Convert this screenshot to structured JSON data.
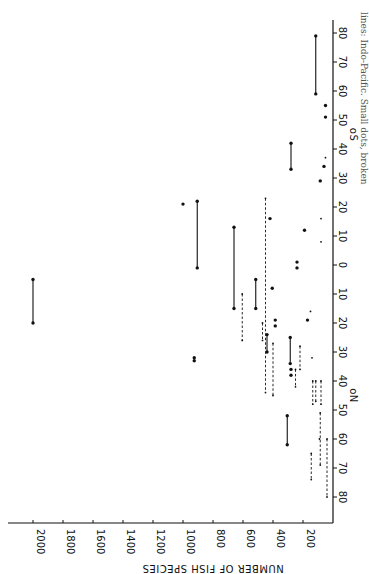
{
  "chart_data": {
    "type": "scatter",
    "title": "",
    "orientation": "rotated 90 degrees clockwise (latitude axis vertical on right, species axis horizontal at bottom)",
    "xlabel": "Latitude",
    "ylabel": "NUMBER OF FISH SPECIES",
    "ylim": [
      0,
      2000
    ],
    "y_ticks": [
      200,
      400,
      600,
      800,
      1000,
      1200,
      1400,
      1600,
      1800,
      2000
    ],
    "x_ticks_north": [
      0,
      10,
      20,
      30,
      40,
      50,
      60,
      70,
      80
    ],
    "x_ticks_south": [
      10,
      20,
      30,
      40,
      50,
      60,
      70,
      80
    ],
    "x_label_north": "oN",
    "x_label_south": "oS",
    "grid": false,
    "legend": "Large dots, solid lines: Indo-Pacific. Small dots, broken lines: other regions",
    "caption_fragment": "lines: Indo-Pacific. Small dots, broken",
    "note": "Latitude in degrees; negative = South, positive = North. Ranges give latitude extent.",
    "series": [
      {
        "name": "Indo-Pacific (large dots, solid lines)",
        "style": "solid",
        "points": [
          {
            "species": 2000,
            "lat_from": 5,
            "lat_to": 20
          },
          {
            "species": 1000,
            "lat": -21
          },
          {
            "species": 905,
            "lat_from": -22,
            "lat_to": 1
          },
          {
            "species": 925,
            "lat": 32
          },
          {
            "species": 925,
            "lat": 33
          },
          {
            "species": 660,
            "lat_from": -13,
            "lat_to": 15
          },
          {
            "species": 515,
            "lat_from": 5,
            "lat_to": 15
          },
          {
            "species": 440,
            "lat_from": 24,
            "lat_to": 30
          },
          {
            "species": 420,
            "lat": -16
          },
          {
            "species": 405,
            "lat": 8
          },
          {
            "species": 385,
            "lat": 19
          },
          {
            "species": 385,
            "lat": 21
          },
          {
            "species": 305,
            "lat_from": 52,
            "lat_to": 62
          },
          {
            "species": 285,
            "lat_from": 25,
            "lat_to": 34
          },
          {
            "species": 280,
            "lat_from": -42,
            "lat_to": -33
          },
          {
            "species": 280,
            "lat": 36
          },
          {
            "species": 280,
            "lat": 38
          },
          {
            "species": 240,
            "lat": 1
          },
          {
            "species": 240,
            "lat": -1
          },
          {
            "species": 190,
            "lat": -12
          },
          {
            "species": 170,
            "lat": 19
          },
          {
            "species": 115,
            "lat_from": -79,
            "lat_to": -59
          },
          {
            "species": 85,
            "lat": -29
          },
          {
            "species": 60,
            "lat": -34
          },
          {
            "species": 50,
            "lat": -51
          },
          {
            "species": 50,
            "lat": -55
          }
        ]
      },
      {
        "name": "Other regions (small dots, broken lines)",
        "style": "dashed",
        "points": [
          {
            "species": 605,
            "lat_from": 10,
            "lat_to": 26
          },
          {
            "species": 470,
            "lat_from": 20,
            "lat_to": 26
          },
          {
            "species": 450,
            "lat_from": -23,
            "lat_to": 44
          },
          {
            "species": 400,
            "lat_from": 27,
            "lat_to": 45
          },
          {
            "species": 250,
            "lat_from": 36,
            "lat_to": 42
          },
          {
            "species": 220,
            "lat_from": 28,
            "lat_to": 36
          },
          {
            "species": 135,
            "lat_from": 40,
            "lat_to": 48
          },
          {
            "species": 115,
            "lat_from": 40,
            "lat_to": 47
          },
          {
            "species": 80,
            "lat_from": 40,
            "lat_to": 48
          },
          {
            "species": 145,
            "lat_from": 65,
            "lat_to": 74
          },
          {
            "species": 85,
            "lat_from": 51,
            "lat_to": 69
          },
          {
            "species": 90,
            "lat": 60
          },
          {
            "species": 40,
            "lat_from": 60,
            "lat_to": 80
          },
          {
            "species": 150,
            "lat": 16
          },
          {
            "species": 140,
            "lat": 32
          },
          {
            "species": 80,
            "lat": -16
          },
          {
            "species": 80,
            "lat": -8
          },
          {
            "species": 50,
            "lat": -37
          }
        ]
      }
    ]
  }
}
